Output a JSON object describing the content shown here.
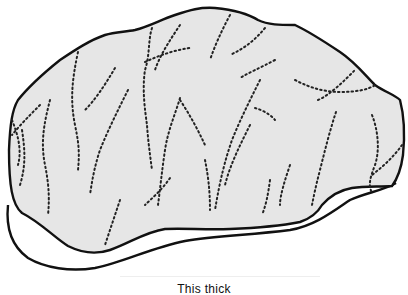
{
  "figure": {
    "colors": {
      "background": "#ffffff",
      "face_fill": "#e6e6e6",
      "outline": "#111111",
      "cracks": "#222222"
    }
  },
  "caption": {
    "text": "This thick"
  }
}
